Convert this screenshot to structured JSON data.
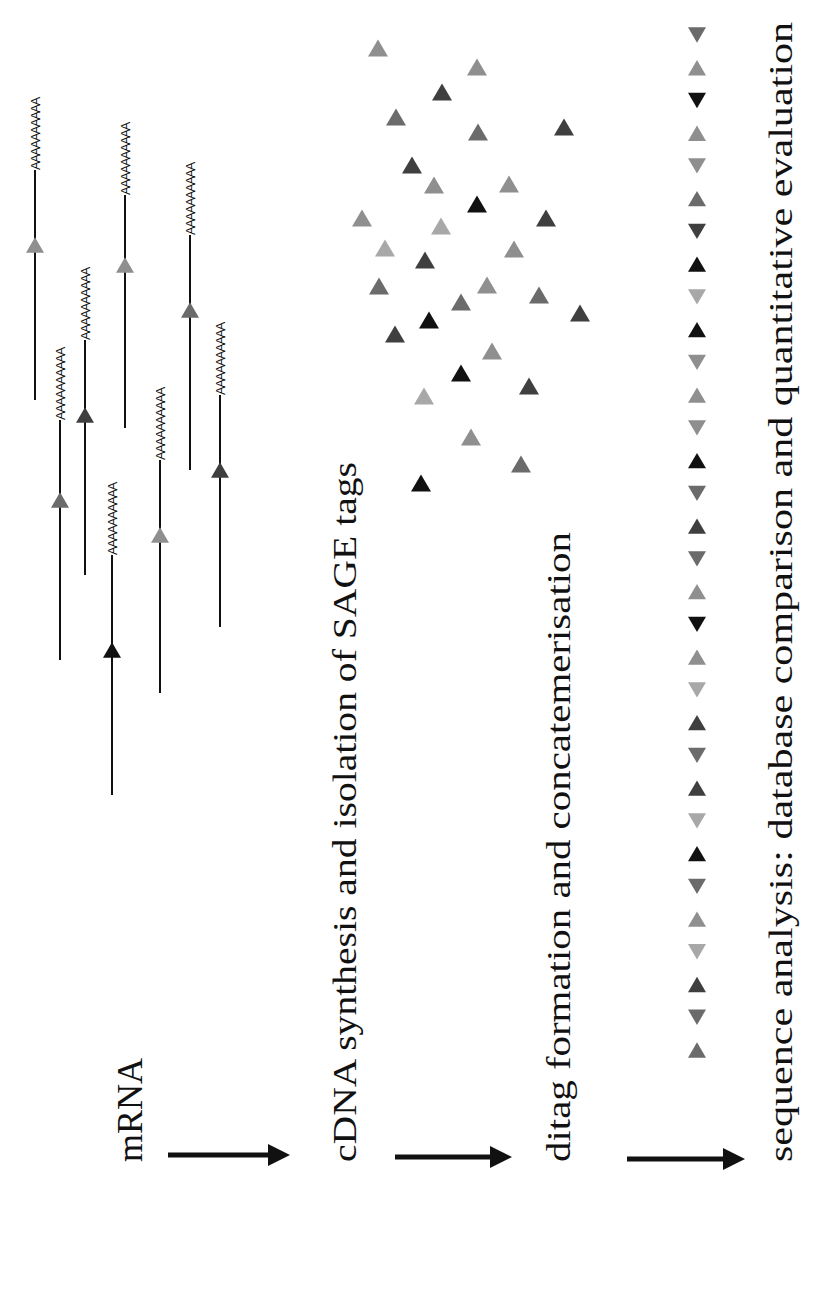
{
  "figure": {
    "orientation": "rotated 90deg counter-clockwise (text reads bottom-to-top)",
    "steps": [
      {
        "id": "mrna",
        "label": "mRNA"
      },
      {
        "id": "cdna",
        "label": "cDNA synthesis and isolation of SAGE tags"
      },
      {
        "id": "ditag",
        "label": "ditag formation and concatemerisation"
      },
      {
        "id": "sequence",
        "label": "sequence analysis: database comparison and quantitative evaluation"
      }
    ],
    "poly_a_tail": "AAAAAAAAAA",
    "colors": {
      "black": "#111111",
      "dark": "#3f3f3f",
      "mid": "#6b6b6b",
      "light": "#8f8f8f",
      "pale": "#a8a8a8"
    },
    "mrna_molecules": [
      {
        "x": 35,
        "y_start": 400,
        "y_end": 170,
        "tag_y": 245,
        "shade": "light"
      },
      {
        "x": 60,
        "y_start": 660,
        "y_end": 420,
        "tag_y": 500,
        "shade": "mid"
      },
      {
        "x": 85,
        "y_start": 575,
        "y_end": 340,
        "tag_y": 415,
        "shade": "dark"
      },
      {
        "x": 112,
        "y_start": 795,
        "y_end": 555,
        "tag_y": 650,
        "shade": "black"
      },
      {
        "x": 125,
        "y_start": 428,
        "y_end": 195,
        "tag_y": 265,
        "shade": "light"
      },
      {
        "x": 160,
        "y_start": 693,
        "y_end": 460,
        "tag_y": 535,
        "shade": "light"
      },
      {
        "x": 190,
        "y_start": 470,
        "y_end": 235,
        "tag_y": 310,
        "shade": "mid"
      },
      {
        "x": 220,
        "y_start": 627,
        "y_end": 395,
        "tag_y": 470,
        "shade": "dark"
      }
    ],
    "free_tags": [
      {
        "x": 378,
        "y": 48,
        "shade": "light"
      },
      {
        "x": 477,
        "y": 67,
        "shade": "light"
      },
      {
        "x": 442,
        "y": 92,
        "shade": "dark"
      },
      {
        "x": 396,
        "y": 117,
        "shade": "mid"
      },
      {
        "x": 478,
        "y": 132,
        "shade": "mid"
      },
      {
        "x": 564,
        "y": 127,
        "shade": "dark"
      },
      {
        "x": 412,
        "y": 165,
        "shade": "dark"
      },
      {
        "x": 434,
        "y": 185,
        "shade": "light"
      },
      {
        "x": 509,
        "y": 184,
        "shade": "light"
      },
      {
        "x": 477,
        "y": 204,
        "shade": "black"
      },
      {
        "x": 362,
        "y": 218,
        "shade": "light"
      },
      {
        "x": 441,
        "y": 226,
        "shade": "pale"
      },
      {
        "x": 546,
        "y": 218,
        "shade": "dark"
      },
      {
        "x": 385,
        "y": 248,
        "shade": "pale"
      },
      {
        "x": 425,
        "y": 260,
        "shade": "dark"
      },
      {
        "x": 514,
        "y": 249,
        "shade": "light"
      },
      {
        "x": 379,
        "y": 286,
        "shade": "mid"
      },
      {
        "x": 487,
        "y": 285,
        "shade": "light"
      },
      {
        "x": 539,
        "y": 295,
        "shade": "mid"
      },
      {
        "x": 461,
        "y": 302,
        "shade": "mid"
      },
      {
        "x": 580,
        "y": 313,
        "shade": "dark"
      },
      {
        "x": 429,
        "y": 320,
        "shade": "black"
      },
      {
        "x": 395,
        "y": 334,
        "shade": "dark"
      },
      {
        "x": 492,
        "y": 351,
        "shade": "light"
      },
      {
        "x": 461,
        "y": 373,
        "shade": "black"
      },
      {
        "x": 529,
        "y": 386,
        "shade": "dark"
      },
      {
        "x": 424,
        "y": 396,
        "shade": "pale"
      },
      {
        "x": 471,
        "y": 437,
        "shade": "light"
      },
      {
        "x": 521,
        "y": 464,
        "shade": "mid"
      },
      {
        "x": 421,
        "y": 483,
        "shade": "black"
      }
    ],
    "concatemer": {
      "x": 697,
      "items": [
        {
          "dir": "down",
          "shade": "mid"
        },
        {
          "dir": "up",
          "shade": "light"
        },
        {
          "dir": "down",
          "shade": "black"
        },
        {
          "dir": "up",
          "shade": "light"
        },
        {
          "dir": "down",
          "shade": "light"
        },
        {
          "dir": "up",
          "shade": "mid"
        },
        {
          "dir": "down",
          "shade": "dark"
        },
        {
          "dir": "up",
          "shade": "black"
        },
        {
          "dir": "down",
          "shade": "pale"
        },
        {
          "dir": "up",
          "shade": "black"
        },
        {
          "dir": "down",
          "shade": "light"
        },
        {
          "dir": "up",
          "shade": "light"
        },
        {
          "dir": "down",
          "shade": "light"
        },
        {
          "dir": "up",
          "shade": "black"
        },
        {
          "dir": "down",
          "shade": "mid"
        },
        {
          "dir": "up",
          "shade": "dark"
        },
        {
          "dir": "down",
          "shade": "mid"
        },
        {
          "dir": "up",
          "shade": "light"
        },
        {
          "dir": "down",
          "shade": "black"
        },
        {
          "dir": "up",
          "shade": "light"
        },
        {
          "dir": "down",
          "shade": "pale"
        },
        {
          "dir": "up",
          "shade": "dark"
        },
        {
          "dir": "down",
          "shade": "mid"
        },
        {
          "dir": "up",
          "shade": "dark"
        },
        {
          "dir": "down",
          "shade": "pale"
        },
        {
          "dir": "up",
          "shade": "black"
        },
        {
          "dir": "down",
          "shade": "mid"
        },
        {
          "dir": "up",
          "shade": "light"
        },
        {
          "dir": "down",
          "shade": "pale"
        },
        {
          "dir": "up",
          "shade": "dark"
        },
        {
          "dir": "down",
          "shade": "mid"
        },
        {
          "dir": "up",
          "shade": "mid"
        }
      ]
    }
  }
}
